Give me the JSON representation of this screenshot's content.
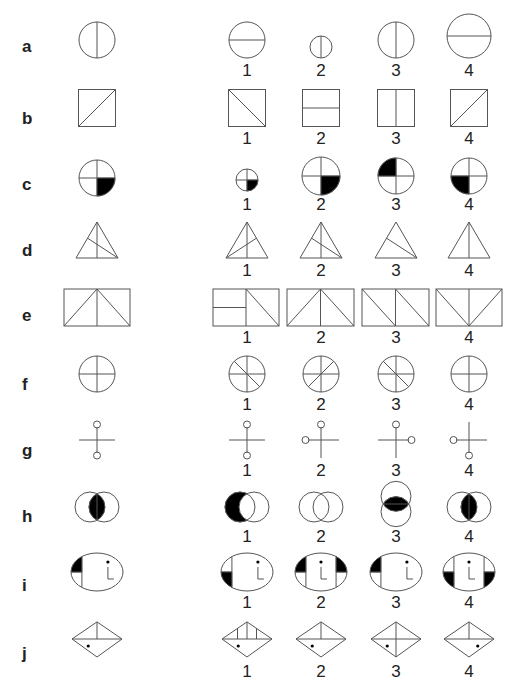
{
  "puzzle": {
    "columns_x": {
      "stimulus": 97,
      "options": [
        247,
        321,
        396,
        469
      ]
    },
    "stroke_color": "#555555",
    "fill_color": "#000000",
    "rows": [
      {
        "label": "a",
        "label_y": 52,
        "num_y": 76,
        "stimulus": {
          "type": "circle",
          "cy": 40,
          "r": 18,
          "line": "vertical"
        },
        "options": [
          {
            "number": "1",
            "type": "circle",
            "cy": 40,
            "r": 18,
            "line": "horizontal"
          },
          {
            "number": "2",
            "type": "circle",
            "cy": 47,
            "r": 11,
            "line": "vertical"
          },
          {
            "number": "3",
            "type": "circle",
            "cy": 40,
            "r": 18,
            "line": "vertical"
          },
          {
            "number": "4",
            "type": "circle",
            "cy": 36,
            "r": 22,
            "line": "horizontal"
          }
        ]
      },
      {
        "label": "b",
        "label_y": 124,
        "num_y": 144,
        "stimulus": {
          "type": "square",
          "cy": 108,
          "s": 37,
          "line": "diag-up"
        },
        "options": [
          {
            "number": "1",
            "type": "square",
            "cy": 108,
            "s": 37,
            "line": "diag-down"
          },
          {
            "number": "2",
            "type": "square",
            "cy": 108,
            "s": 37,
            "line": "horizontal"
          },
          {
            "number": "3",
            "type": "square",
            "cy": 108,
            "s": 37,
            "line": "vertical"
          },
          {
            "number": "4",
            "type": "square",
            "cy": 108,
            "s": 37,
            "line": "diag-up"
          }
        ]
      },
      {
        "label": "c",
        "label_y": 190,
        "num_y": 210,
        "stimulus": {
          "type": "quad-circle",
          "cy": 178,
          "r": 18,
          "filled": "bottom-right"
        },
        "options": [
          {
            "number": "1",
            "type": "quad-circle",
            "cy": 180,
            "r": 11,
            "filled": "bottom-right"
          },
          {
            "number": "2",
            "type": "quad-circle",
            "cy": 176,
            "r": 19,
            "filled": "bottom-right"
          },
          {
            "number": "3",
            "type": "quad-circle",
            "cy": 176,
            "r": 18,
            "filled": "top-left"
          },
          {
            "number": "4",
            "type": "quad-circle",
            "cy": 176,
            "r": 18,
            "filled": "bottom-left"
          }
        ]
      },
      {
        "label": "d",
        "label_y": 256,
        "num_y": 276,
        "stimulus": {
          "type": "triangle",
          "top": 222,
          "bottom": 258,
          "hw": 21,
          "variant": "median-plus-left-cevian"
        },
        "options": [
          {
            "number": "1",
            "type": "triangle",
            "top": 222,
            "bottom": 258,
            "hw": 21,
            "variant": "median-plus-right-cevian"
          },
          {
            "number": "2",
            "type": "triangle",
            "top": 222,
            "bottom": 258,
            "hw": 21,
            "variant": "median-plus-left-cevian"
          },
          {
            "number": "3",
            "type": "triangle",
            "top": 222,
            "bottom": 258,
            "hw": 21,
            "variant": "left-cevian-only"
          },
          {
            "number": "4",
            "type": "triangle",
            "top": 222,
            "bottom": 258,
            "hw": 21,
            "variant": "median-only"
          }
        ]
      },
      {
        "label": "e",
        "label_y": 321,
        "num_y": 343,
        "stimulus": {
          "type": "rect",
          "x": 64,
          "w": 66,
          "top": 289,
          "bottom": 326,
          "variant": "peak-center"
        },
        "options": [
          {
            "number": "1",
            "type": "rect",
            "x": 213,
            "w": 66,
            "top": 289,
            "bottom": 326,
            "variant": "left-half-split-right-diag"
          },
          {
            "number": "2",
            "type": "rect",
            "x": 287,
            "w": 67,
            "top": 289,
            "bottom": 326,
            "variant": "peak-center"
          },
          {
            "number": "3",
            "type": "rect",
            "x": 362,
            "w": 67,
            "top": 289,
            "bottom": 326,
            "variant": "double-down-diag"
          },
          {
            "number": "4",
            "type": "rect",
            "x": 436,
            "w": 66,
            "top": 289,
            "bottom": 326,
            "variant": "valley-center"
          }
        ]
      },
      {
        "label": "f",
        "label_y": 390,
        "num_y": 410,
        "stimulus": {
          "type": "spoke-circle",
          "cy": 374,
          "r": 18,
          "diag": "none"
        },
        "options": [
          {
            "number": "1",
            "type": "spoke-circle",
            "cy": 374,
            "r": 18,
            "diag": "down"
          },
          {
            "number": "2",
            "type": "spoke-circle",
            "cy": 374,
            "r": 18,
            "diag": "up"
          },
          {
            "number": "3",
            "type": "spoke-circle",
            "cy": 374,
            "r": 18,
            "diag": "down"
          },
          {
            "number": "4",
            "type": "spoke-circle",
            "cy": 374,
            "r": 18,
            "diag": "none"
          }
        ]
      },
      {
        "label": "g",
        "label_y": 456,
        "num_y": 476,
        "stimulus": {
          "type": "cross",
          "cy": 440,
          "arm": 18,
          "knobs": [
            "top",
            "bottom"
          ]
        },
        "options": [
          {
            "number": "1",
            "type": "cross",
            "cy": 440,
            "arm": 18,
            "knobs": [
              "top",
              "bottom"
            ]
          },
          {
            "number": "2",
            "type": "cross",
            "cy": 440,
            "arm": 18,
            "knobs": [
              "top",
              "left"
            ]
          },
          {
            "number": "3",
            "type": "cross",
            "cy": 440,
            "arm": 18,
            "knobs": [
              "top",
              "right"
            ]
          },
          {
            "number": "4",
            "type": "cross",
            "cy": 440,
            "arm": 18,
            "knobs": [
              "left",
              "bottom"
            ]
          }
        ]
      },
      {
        "label": "h",
        "label_y": 522,
        "num_y": 542,
        "stimulus": {
          "type": "venn",
          "cy": 507,
          "r": 15,
          "offset": 7,
          "orient": "horizontal",
          "shade": "lens"
        },
        "options": [
          {
            "number": "1",
            "type": "venn",
            "cy": 507,
            "r": 15,
            "offset": 7,
            "orient": "horizontal",
            "shade": "left-crescent"
          },
          {
            "number": "2",
            "type": "venn",
            "cy": 507,
            "r": 15,
            "offset": 7,
            "orient": "horizontal",
            "shade": "none"
          },
          {
            "number": "3",
            "type": "venn",
            "cy": 504,
            "r": 15,
            "offset": 7,
            "orient": "vertical",
            "shade": "lens"
          },
          {
            "number": "4",
            "type": "venn",
            "cy": 507,
            "r": 15,
            "offset": 7,
            "orient": "horizontal",
            "shade": "lens"
          }
        ]
      },
      {
        "label": "i",
        "label_y": 591,
        "num_y": 608,
        "stimulus": {
          "type": "ellipse-i",
          "cy": 572,
          "rx": 26,
          "ry": 19,
          "left_fill": "top",
          "right_band": false,
          "right_fill": "none"
        },
        "options": [
          {
            "number": "1",
            "type": "ellipse-i",
            "cy": 572,
            "rx": 26,
            "ry": 19,
            "left_fill": "bottom",
            "right_band": false,
            "right_fill": "none"
          },
          {
            "number": "2",
            "type": "ellipse-i",
            "cy": 572,
            "rx": 26,
            "ry": 19,
            "left_fill": "top",
            "right_band": true,
            "right_fill": "top"
          },
          {
            "number": "3",
            "type": "ellipse-i",
            "cy": 572,
            "rx": 26,
            "ry": 19,
            "left_fill": "top",
            "right_band": false,
            "right_fill": "none"
          },
          {
            "number": "4",
            "type": "ellipse-i",
            "cy": 572,
            "rx": 26,
            "ry": 19,
            "left_fill": "bottom",
            "right_band": true,
            "right_fill": "bottom"
          }
        ]
      },
      {
        "label": "j",
        "label_y": 659,
        "num_y": 677,
        "stimulus": {
          "type": "diamond",
          "cy": 639,
          "hw": 25,
          "hh": 18,
          "variant": "center-tick",
          "dot": "left"
        },
        "options": [
          {
            "number": "1",
            "type": "diamond",
            "cy": 639,
            "hw": 25,
            "hh": 18,
            "variant": "three-ticks",
            "dot": "left"
          },
          {
            "number": "2",
            "type": "diamond",
            "cy": 639,
            "hw": 25,
            "hh": 18,
            "variant": "center-tick",
            "dot": "left"
          },
          {
            "number": "3",
            "type": "diamond",
            "cy": 639,
            "hw": 25,
            "hh": 18,
            "variant": "full-cross",
            "dot": "left"
          },
          {
            "number": "4",
            "type": "diamond",
            "cy": 639,
            "hw": 25,
            "hh": 18,
            "variant": "center-tick",
            "dot": "right"
          }
        ]
      }
    ]
  }
}
